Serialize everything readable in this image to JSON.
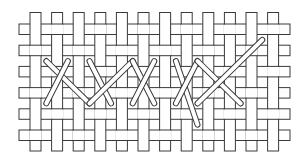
{
  "diagram": {
    "title": "Woven canvas with herringbone cross stitch",
    "colors": {
      "background": "#ffffff",
      "outline": "#3a3a3a",
      "strip_fill": "#ffffff",
      "thread_fill": "#ffffff"
    },
    "canvas": {
      "vertical_threads": 12,
      "horizontal_threads": 6,
      "weave": "plain (over-one, under-one); horizontal over vertical when row+column is odd"
    },
    "stitches": [
      {
        "from": [
          0,
          1
        ],
        "to": [
          2,
          3
        ]
      },
      {
        "from": [
          1,
          1
        ],
        "to": [
          0,
          3
        ]
      },
      {
        "from": [
          2,
          1
        ],
        "to": [
          3,
          3
        ]
      },
      {
        "from": [
          2,
          3
        ],
        "to": [
          4,
          1
        ]
      },
      {
        "from": [
          4,
          1
        ],
        "to": [
          5,
          3
        ]
      },
      {
        "from": [
          5,
          1
        ],
        "to": [
          4,
          3
        ]
      },
      {
        "from": [
          6,
          1
        ],
        "to": [
          7,
          4
        ]
      },
      {
        "from": [
          7,
          1
        ],
        "to": [
          6,
          3
        ]
      },
      {
        "from": [
          7,
          1
        ],
        "to": [
          9,
          3
        ]
      },
      {
        "from": [
          10,
          0
        ],
        "to": [
          7,
          3
        ]
      }
    ],
    "stitch_coordinate_note": "stitch points are [gap between vertical threads, gap between horizontal threads], zero-indexed"
  }
}
